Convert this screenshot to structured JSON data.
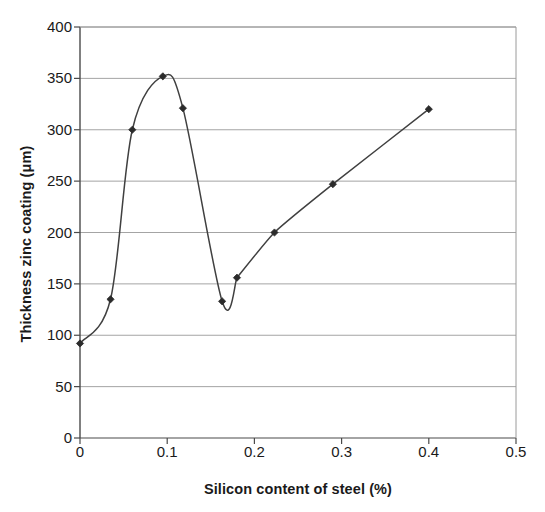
{
  "chart_data": {
    "type": "line",
    "title": "",
    "xlabel": "Silicon content of steel (%)",
    "ylabel": "Thickness zinc coating (μm)",
    "xlim": [
      0,
      0.5
    ],
    "ylim": [
      0,
      400
    ],
    "xticks": [
      0,
      0.1,
      0.2,
      0.3,
      0.4,
      0.5
    ],
    "xtick_labels": [
      "0",
      "0.1",
      "0.2",
      "0.3",
      "0.4",
      "0.5"
    ],
    "yticks": [
      0,
      50,
      100,
      150,
      200,
      250,
      300,
      350,
      400
    ],
    "ytick_labels": [
      "0",
      "50",
      "100",
      "150",
      "200",
      "250",
      "300",
      "350",
      "400"
    ],
    "grid": "horizontal",
    "legend": "none",
    "marker": "diamond",
    "line_color": "#404040",
    "marker_color": "#2b2b2b",
    "grid_color": "#9a9a9a",
    "axis_color": "#555555",
    "series": [
      {
        "name": "Zinc coating thickness",
        "x": [
          0.0,
          0.035,
          0.06,
          0.095,
          0.118,
          0.163,
          0.18,
          0.223,
          0.29,
          0.4
        ],
        "y": [
          92,
          135,
          300,
          352,
          321,
          133,
          156,
          200,
          247,
          320
        ]
      }
    ]
  },
  "figure": {
    "plot_area": {
      "left": 80,
      "right": 516,
      "top": 27,
      "bottom": 438
    }
  }
}
